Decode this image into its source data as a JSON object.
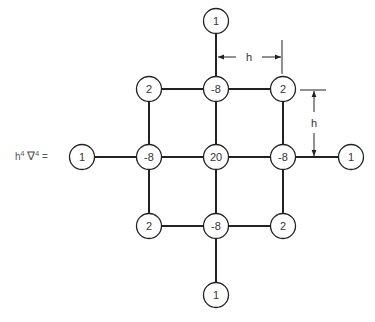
{
  "formula": {
    "h": "h",
    "h_exp": "4",
    "nabla": "∇",
    "nabla_exp": "4",
    "equals": "="
  },
  "dimension_labels": {
    "horizontal": "h",
    "vertical": "h"
  },
  "stencil": {
    "description": "13-point biharmonic finite-difference stencil",
    "nodes": [
      {
        "id": "top",
        "value": "1",
        "cx": 216,
        "cy": 21
      },
      {
        "id": "upper-left",
        "value": "2",
        "cx": 149,
        "cy": 89
      },
      {
        "id": "upper-center",
        "value": "-8",
        "cx": 216,
        "cy": 89
      },
      {
        "id": "upper-right",
        "value": "2",
        "cx": 283,
        "cy": 89
      },
      {
        "id": "far-left",
        "value": "1",
        "cx": 82,
        "cy": 157
      },
      {
        "id": "mid-left",
        "value": "-8",
        "cx": 149,
        "cy": 157
      },
      {
        "id": "center",
        "value": "20",
        "cx": 216,
        "cy": 157
      },
      {
        "id": "mid-right",
        "value": "-8",
        "cx": 283,
        "cy": 157
      },
      {
        "id": "far-right",
        "value": "1",
        "cx": 351,
        "cy": 157
      },
      {
        "id": "lower-left",
        "value": "2",
        "cx": 149,
        "cy": 226
      },
      {
        "id": "lower-center",
        "value": "-8",
        "cx": 216,
        "cy": 226
      },
      {
        "id": "lower-right",
        "value": "2",
        "cx": 283,
        "cy": 226
      },
      {
        "id": "bottom",
        "value": "1",
        "cx": 216,
        "cy": 295
      }
    ]
  }
}
